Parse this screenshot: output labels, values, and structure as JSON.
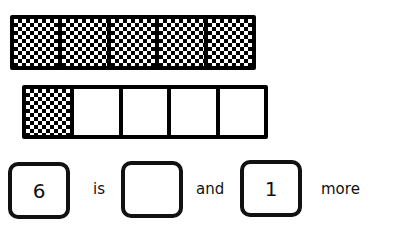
{
  "ten_frame_top": {
    "cells": [
      {
        "filled": true
      },
      {
        "filled": true
      },
      {
        "filled": true
      },
      {
        "filled": true
      },
      {
        "filled": true
      }
    ]
  },
  "ten_frame_bottom": {
    "cells": [
      {
        "filled": true
      },
      {
        "filled": false
      },
      {
        "filled": false
      },
      {
        "filled": false
      },
      {
        "filled": false
      }
    ]
  },
  "sentence": {
    "total_value": "6",
    "word_is": "is",
    "blank_value": "",
    "word_and": "and",
    "more_value": "1",
    "word_more": "more"
  },
  "colors": {
    "ink": "#000000",
    "background": "#ffffff"
  }
}
